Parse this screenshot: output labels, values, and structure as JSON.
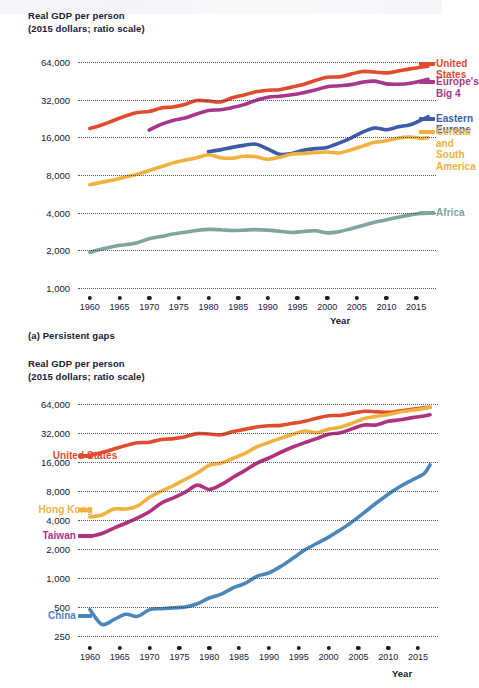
{
  "page": {
    "width": 442,
    "height": 688
  },
  "colors": {
    "united_states": "#E24B2E",
    "europes_big_4": "#A8368A",
    "eastern_europe": "#3A5BA8",
    "central_and_south_america": "#F0B23F",
    "africa": "#7EA69E",
    "hong_kong": "#F0B23F",
    "taiwan": "#B0317E",
    "china": "#4B86B9",
    "axis_text": "#16203a",
    "gridline": "#3b3f52",
    "background": "#ffffff"
  },
  "panel_a": {
    "axis_title": "Real GDP per person\n(2015 dollars; ratio scale)",
    "caption": "(a) Persistent gaps",
    "x_axis_title": "Year"
  },
  "panel_b": {
    "axis_title": "Real GDP per person\n(2015 dollars; ratio scale)",
    "x_axis_title": "Year"
  },
  "chart_data": [
    {
      "id": "panel-a",
      "type": "line",
      "title": "Real GDP per person",
      "subtitle": "(2015 dollars; ratio scale)",
      "caption": "(a) Persistent gaps",
      "xlabel": "Year",
      "ylabel": "Real GDP per person (2015 dollars; ratio scale)",
      "yscale": "log",
      "ylim": [
        1000,
        90000
      ],
      "yticks": [
        1000,
        2000,
        4000,
        8000,
        16000,
        32000,
        64000
      ],
      "ytick_labels": [
        "1,000",
        "2,000",
        "4,000",
        "8,000",
        "16,000",
        "32,000",
        "64,000"
      ],
      "xlim": [
        1958,
        2017
      ],
      "xticks": [
        1960,
        1965,
        1970,
        1975,
        1980,
        1985,
        1990,
        1995,
        2000,
        2005,
        2010,
        2015
      ],
      "xtick_labels": [
        "1960",
        "1965",
        "1970",
        "1975",
        "1980",
        "1985",
        "1990",
        "1995",
        "2000",
        "2005",
        "2010",
        "2015"
      ],
      "grid": "dotted-horizontal",
      "legend_position": "right-inline",
      "series": [
        {
          "name": "United States",
          "color": "#E24B2E",
          "label_y": 62000,
          "x": [
            1960,
            1962,
            1964,
            1966,
            1968,
            1970,
            1972,
            1974,
            1976,
            1978,
            1980,
            1982,
            1984,
            1986,
            1988,
            1990,
            1992,
            1994,
            1996,
            1998,
            2000,
            2002,
            2004,
            2006,
            2008,
            2010,
            2012,
            2014,
            2016,
            2017
          ],
          "values": [
            18800,
            20100,
            21800,
            23700,
            25300,
            25700,
            27400,
            28000,
            29300,
            31500,
            31200,
            30700,
            33200,
            34900,
            37000,
            38100,
            38400,
            40300,
            42300,
            45500,
            48400,
            48700,
            51200,
            53800,
            53200,
            52400,
            54300,
            56400,
            58300,
            59200
          ]
        },
        {
          "name": "Europe's Big 4",
          "color": "#A8368A",
          "label_y": 44000,
          "x": [
            1970,
            1972,
            1974,
            1976,
            1978,
            1980,
            1982,
            1984,
            1986,
            1988,
            1990,
            1992,
            1994,
            1996,
            1998,
            2000,
            2002,
            2004,
            2006,
            2008,
            2010,
            2012,
            2014,
            2016,
            2017
          ],
          "values": [
            18300,
            20300,
            21800,
            22800,
            24600,
            26200,
            26600,
            27700,
            29200,
            31600,
            33500,
            34100,
            35000,
            36400,
            38300,
            40600,
            41300,
            42200,
            44200,
            45000,
            42800,
            42500,
            43300,
            45300,
            46600
          ]
        },
        {
          "name": "Eastern Europe",
          "color": "#3A5BA8",
          "label_y": 22500,
          "x": [
            1980,
            1982,
            1984,
            1986,
            1988,
            1990,
            1992,
            1994,
            1996,
            1998,
            2000,
            2002,
            2004,
            2006,
            2008,
            2010,
            2012,
            2014,
            2016,
            2017
          ],
          "values": [
            12300,
            12700,
            13300,
            13800,
            14100,
            12900,
            11700,
            11900,
            12600,
            13000,
            13300,
            14400,
            15800,
            17600,
            19000,
            18400,
            19400,
            20200,
            22200,
            23400
          ]
        },
        {
          "name": "Central and\nSouth America",
          "color": "#F0B23F",
          "label_y": 17500,
          "x": [
            1960,
            1962,
            1964,
            1966,
            1968,
            1970,
            1972,
            1974,
            1976,
            1978,
            1980,
            1982,
            1984,
            1986,
            1988,
            1990,
            1992,
            1994,
            1996,
            1998,
            2000,
            2002,
            2004,
            2006,
            2008,
            2010,
            2012,
            2014,
            2016,
            2017
          ],
          "values": [
            6700,
            7000,
            7300,
            7700,
            8100,
            8700,
            9300,
            10000,
            10500,
            11000,
            11600,
            11000,
            10900,
            11300,
            11200,
            10700,
            11100,
            11700,
            11900,
            12100,
            12200,
            12000,
            12700,
            13600,
            14600,
            15000,
            15800,
            16100,
            15700,
            15900
          ]
        },
        {
          "name": "Africa",
          "color": "#7EA69E",
          "label_y": 3950,
          "x": [
            1960,
            1962,
            1964,
            1966,
            1968,
            1970,
            1972,
            1974,
            1976,
            1978,
            1980,
            1982,
            1984,
            1986,
            1988,
            1990,
            1992,
            1994,
            1996,
            1998,
            2000,
            2002,
            2004,
            2006,
            2008,
            2010,
            2012,
            2014,
            2016,
            2017
          ],
          "values": [
            1930,
            2050,
            2150,
            2220,
            2300,
            2480,
            2580,
            2700,
            2790,
            2880,
            2940,
            2920,
            2880,
            2900,
            2930,
            2900,
            2840,
            2780,
            2830,
            2870,
            2760,
            2820,
            2980,
            3160,
            3360,
            3510,
            3680,
            3840,
            3940,
            3970
          ]
        }
      ]
    },
    {
      "id": "panel-b",
      "type": "line",
      "title": "Real GDP per person",
      "subtitle": "(2015 dollars; ratio scale)",
      "xlabel": "Year",
      "ylabel": "Real GDP per person (2015 dollars; ratio scale)",
      "yscale": "log",
      "ylim": [
        250,
        90000
      ],
      "yticks": [
        250,
        500,
        1000,
        2000,
        4000,
        8000,
        16000,
        32000,
        64000
      ],
      "ytick_labels": [
        "250",
        "500",
        "1,000",
        "2,000",
        "4,000",
        "8,000",
        "16,000",
        "32,000",
        "64,000"
      ],
      "xlim": [
        1958,
        2017
      ],
      "xticks": [
        1960,
        1965,
        1970,
        1975,
        1980,
        1985,
        1990,
        1995,
        2000,
        2005,
        2010,
        2015
      ],
      "xtick_labels": [
        "1960",
        "1965",
        "1970",
        "1975",
        "1980",
        "1985",
        "1990",
        "1995",
        "2000",
        "2005",
        "2010",
        "2015"
      ],
      "grid": "dotted-horizontal",
      "legend_position": "left-inline",
      "series": [
        {
          "name": "United States",
          "color": "#E24B2E",
          "label_y": 18500,
          "x": [
            1960,
            1962,
            1964,
            1966,
            1968,
            1970,
            1972,
            1974,
            1976,
            1978,
            1980,
            1982,
            1984,
            1986,
            1988,
            1990,
            1992,
            1994,
            1996,
            1998,
            2000,
            2002,
            2004,
            2006,
            2008,
            2010,
            2012,
            2014,
            2016,
            2017
          ],
          "values": [
            18800,
            20100,
            21800,
            23700,
            25300,
            25700,
            27400,
            28000,
            29300,
            31500,
            31200,
            30700,
            33200,
            34900,
            37000,
            38100,
            38400,
            40300,
            42300,
            45500,
            48400,
            48700,
            51200,
            53800,
            53200,
            52400,
            54300,
            56400,
            58300,
            59200
          ]
        },
        {
          "name": "Hong Kong",
          "color": "#F0B23F",
          "label_y": 5100,
          "x": [
            1960,
            1962,
            1964,
            1966,
            1968,
            1970,
            1972,
            1974,
            1976,
            1978,
            1980,
            1982,
            1984,
            1986,
            1988,
            1990,
            1992,
            1994,
            1996,
            1998,
            2000,
            2002,
            2004,
            2006,
            2008,
            2010,
            2012,
            2014,
            2016,
            2017
          ],
          "values": [
            4300,
            4500,
            5200,
            5200,
            5600,
            6900,
            8000,
            9100,
            10600,
            12300,
            14800,
            15600,
            17500,
            19700,
            23000,
            25600,
            28200,
            31000,
            33600,
            32200,
            35000,
            36800,
            40500,
            45300,
            47800,
            49800,
            52900,
            55000,
            57500,
            59600
          ]
        },
        {
          "name": "Taiwan",
          "color": "#B0317E",
          "label_y": 2750,
          "x": [
            1960,
            1962,
            1964,
            1966,
            1968,
            1970,
            1972,
            1974,
            1976,
            1978,
            1980,
            1982,
            1984,
            1986,
            1988,
            1990,
            1992,
            1994,
            1996,
            1998,
            2000,
            2002,
            2004,
            2006,
            2008,
            2010,
            2012,
            2014,
            2016,
            2017
          ],
          "values": [
            2700,
            2900,
            3300,
            3700,
            4200,
            4900,
            6000,
            6800,
            7800,
            9200,
            8300,
            9300,
            11100,
            13100,
            15600,
            17600,
            20200,
            22900,
            25400,
            28000,
            31000,
            32200,
            35500,
            38700,
            38800,
            42300,
            43900,
            46200,
            48000,
            49400
          ]
        },
        {
          "name": "China",
          "color": "#4B86B9",
          "label_y": 400,
          "x": [
            1960,
            1962,
            1964,
            1966,
            1968,
            1970,
            1972,
            1974,
            1976,
            1978,
            1980,
            1982,
            1984,
            1986,
            1988,
            1990,
            1992,
            1994,
            1996,
            1998,
            2000,
            2002,
            2004,
            2006,
            2008,
            2010,
            2012,
            2014,
            2016,
            2017
          ],
          "values": [
            470,
            330,
            370,
            420,
            400,
            470,
            480,
            490,
            500,
            540,
            620,
            680,
            790,
            880,
            1040,
            1130,
            1320,
            1600,
            1950,
            2280,
            2660,
            3160,
            3850,
            4800,
            6000,
            7400,
            8900,
            10400,
            12100,
            14900
          ]
        }
      ]
    }
  ]
}
